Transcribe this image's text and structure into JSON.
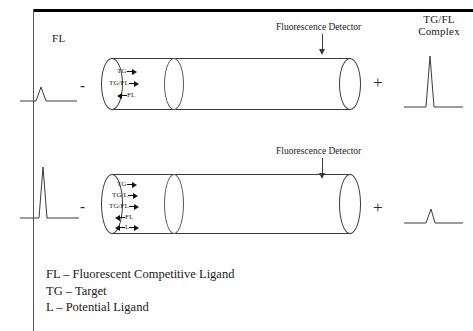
{
  "figure": {
    "frame_color": "#000000",
    "line_color": "#3a3a3a",
    "background": "#ffffff"
  },
  "top_row": {
    "left_peak_label": "FL",
    "right_peak_label": "TG/FL Complex",
    "detector_label": "Fluorescence Detector",
    "operator_left": "-",
    "operator_right": "+",
    "species": [
      {
        "name": "TG",
        "arrow": "right"
      },
      {
        "name": "TG/FL",
        "arrow": "right"
      },
      {
        "name": "FL",
        "arrow": "left"
      }
    ],
    "left_peak": {
      "type": "small",
      "description": "short broad peak"
    },
    "right_peak": {
      "type": "large",
      "description": "tall narrow peak"
    }
  },
  "bottom_row": {
    "detector_label": "Fluorescence Detector",
    "operator_left": "-",
    "operator_right": "+",
    "species": [
      {
        "name": "TG",
        "arrow": "right"
      },
      {
        "name": "TG/L",
        "arrow": "right"
      },
      {
        "name": "TG/FL",
        "arrow": "right"
      },
      {
        "name": "FL",
        "arrow": "left"
      },
      {
        "name": "L",
        "arrow": "both"
      }
    ],
    "left_peak": {
      "type": "large",
      "description": "tall narrow peak"
    },
    "right_peak": {
      "type": "small",
      "description": "short narrow peak"
    }
  },
  "legend": {
    "lines": [
      "FL – Fluorescent Competitive Ligand",
      "TG – Target",
      "L – Potential Ligand"
    ]
  }
}
